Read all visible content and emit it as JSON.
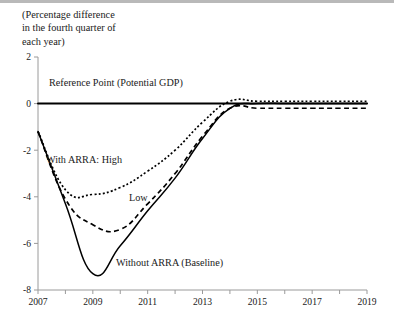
{
  "figure": {
    "unit_note": "(Percentage difference\nin the fourth quarter of\neach year)"
  },
  "labels": {
    "reference": "Reference Point (Potential GDP)",
    "high": "With ARRA: High",
    "low": "Low",
    "baseline": "Without ARRA (Baseline)"
  },
  "colors": {
    "line": "#000000",
    "axis": "#9a9a9a",
    "text": "#1a1a1a",
    "top_rule": "#b9b9b9"
  },
  "chart_data": {
    "type": "line",
    "title": "",
    "subtitle": "(Percentage difference in the fourth quarter of each year)",
    "xlabel": "",
    "ylabel": "",
    "xlim": [
      2007,
      2019
    ],
    "ylim": [
      -8,
      2
    ],
    "yticks": [
      2,
      0,
      -2,
      -4,
      -6,
      -8
    ],
    "ytick_labels": [
      "2",
      "0",
      "-2",
      "-4",
      "-6",
      "-8"
    ],
    "xticks": [
      2007,
      2008,
      2009,
      2010,
      2011,
      2012,
      2013,
      2014,
      2015,
      2016,
      2017,
      2018,
      2019
    ],
    "xtick_labels": [
      "2007",
      "",
      "2009",
      "",
      "2011",
      "",
      "2013",
      "",
      "2015",
      "",
      "2017",
      "",
      "2019"
    ],
    "grid": false,
    "legend": "inline-annotations",
    "x": [
      2007,
      2008,
      2009,
      2010,
      2011,
      2012,
      2013,
      2014,
      2015,
      2016,
      2017,
      2018,
      2019
    ],
    "series": [
      {
        "name": "Reference Point (Potential GDP)",
        "style": "solid-thick",
        "values": [
          0,
          0,
          0,
          0,
          0,
          0,
          0,
          0,
          0,
          0,
          0,
          0,
          0
        ]
      },
      {
        "name": "With ARRA: High",
        "style": "dotted",
        "values": [
          -1.2,
          -3.7,
          -3.9,
          -3.6,
          -2.9,
          -2.0,
          -0.8,
          0.1,
          0.1,
          0.1,
          0.1,
          0.1,
          0.1
        ]
      },
      {
        "name": "Low",
        "style": "dashed",
        "values": [
          -1.2,
          -4.1,
          -5.2,
          -5.4,
          -4.3,
          -3.0,
          -1.4,
          -0.2,
          -0.2,
          -0.2,
          -0.2,
          -0.2,
          -0.2
        ]
      },
      {
        "name": "Without ARRA (Baseline)",
        "style": "solid",
        "values": [
          -1.2,
          -4.3,
          -7.3,
          -6.1,
          -4.6,
          -3.2,
          -1.5,
          -0.2,
          0.0,
          0.0,
          0.0,
          0.0,
          0.0
        ]
      }
    ]
  }
}
